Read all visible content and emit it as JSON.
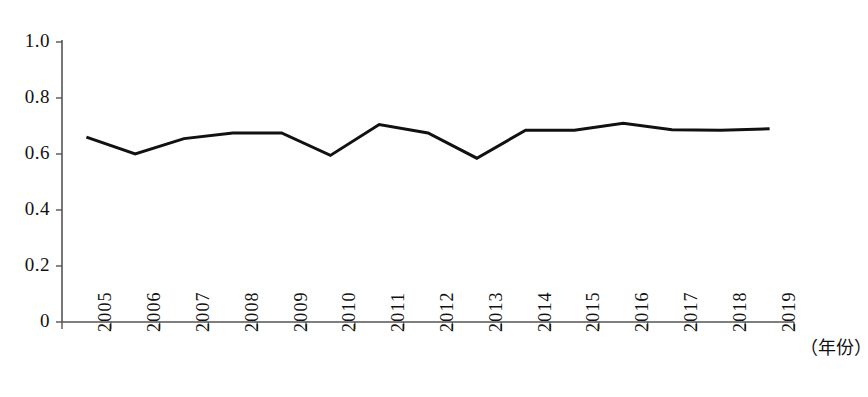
{
  "chart_data": {
    "type": "line",
    "title": "",
    "subtitle": "",
    "xlabel": "（年份）",
    "ylabel": "",
    "categories": [
      "2005",
      "2006",
      "2007",
      "2008",
      "2009",
      "2010",
      "2011",
      "2012",
      "2013",
      "2014",
      "2015",
      "2016",
      "2017",
      "2018",
      "2019"
    ],
    "values": [
      0.66,
      0.6,
      0.655,
      0.675,
      0.675,
      0.595,
      0.705,
      0.675,
      0.585,
      0.685,
      0.685,
      0.71,
      0.687,
      0.685,
      0.69
    ],
    "series": [
      {
        "name": "",
        "values": [
          0.66,
          0.6,
          0.655,
          0.675,
          0.675,
          0.595,
          0.705,
          0.675,
          0.585,
          0.685,
          0.685,
          0.71,
          0.687,
          0.685,
          0.69
        ]
      }
    ],
    "ylim": [
      0,
      1.0
    ],
    "ytick_labels": [
      "1.0",
      "0.8",
      "0.6",
      "0.4",
      "0.2",
      "0"
    ],
    "ytick_values": [
      1.0,
      0.8,
      0.6,
      0.4,
      0.2,
      0
    ],
    "xtick_labels": [
      "2005",
      "2006",
      "2007",
      "2008",
      "2009",
      "2010",
      "2011",
      "2012",
      "2013",
      "2014",
      "2015",
      "2016",
      "2017",
      "2018",
      "2019"
    ],
    "grid": false,
    "legend": false,
    "legend_position": "none",
    "line_color": "#111111",
    "line_width": 3,
    "axis_color": "#555555",
    "background_color": "#ffffff",
    "annotations": []
  },
  "axis": {
    "x_unit_label": "（年份）"
  }
}
